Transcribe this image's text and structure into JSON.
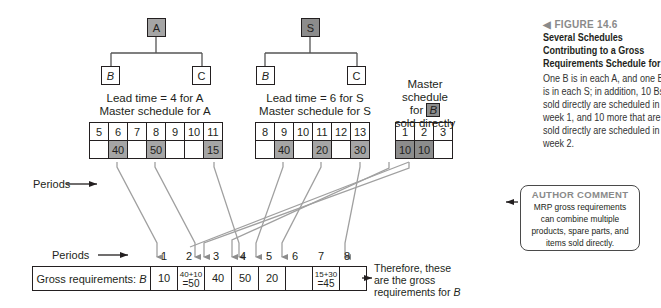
{
  "figure": {
    "number": "FIGURE 14.6",
    "marker_icon": "left-triangle",
    "title_lines": [
      "Several Schedules",
      "Contributing to a Gross",
      "Requirements Schedule for B"
    ],
    "description_lines": [
      "One B is in each A, and one B",
      "is in each S; in addition, 10 Bs",
      "sold directly are scheduled in",
      "week 1, and 10 more that are",
      "sold directly are scheduled in",
      "week 2."
    ]
  },
  "author_comment": {
    "heading": "AUTHOR COMMENT",
    "lines": [
      "MRP gross requirements",
      "can combine multiple",
      "products, spare parts, and",
      "items sold directly."
    ]
  },
  "trees": [
    {
      "parent": "A",
      "children": [
        "B",
        "C"
      ],
      "caption_lines": [
        "Lead time = 4 for A",
        "Master schedule for A"
      ]
    },
    {
      "parent": "S",
      "children": [
        "B",
        "C"
      ],
      "caption_lines": [
        "Lead time = 6 for S",
        "Master schedule for S"
      ]
    }
  ],
  "direct_caption": {
    "line1": "Master schedule",
    "line2_pre": "for",
    "line2_item": "B",
    "line3": "sold directly"
  },
  "periods_label": "Periods",
  "schedules": {
    "A": {
      "periods": [
        "5",
        "6",
        "7",
        "8",
        "9",
        "10",
        "11"
      ],
      "quantities": [
        "",
        "40",
        "",
        "50",
        "",
        "",
        "15"
      ]
    },
    "S": {
      "periods": [
        "8",
        "9",
        "10",
        "11",
        "12",
        "13"
      ],
      "quantities": [
        "",
        "40",
        "",
        "20",
        "",
        "30"
      ]
    },
    "direct": {
      "periods": [
        "1",
        "2",
        "3"
      ],
      "quantities": [
        "10",
        "10",
        ""
      ]
    }
  },
  "gross": {
    "label": "Gross requirements:",
    "label_item": "B",
    "periods": [
      "1",
      "2",
      "3",
      "4",
      "5",
      "6",
      "7",
      "8"
    ],
    "cells": [
      {
        "top": "",
        "value": "10"
      },
      {
        "top": "40+10",
        "value": "=50"
      },
      {
        "top": "",
        "value": "40"
      },
      {
        "top": "",
        "value": "50"
      },
      {
        "top": "",
        "value": "20"
      },
      {
        "top": "",
        "value": ""
      },
      {
        "top": "15+30",
        "value": "=45"
      },
      {
        "top": "",
        "value": ""
      }
    ]
  },
  "therefore_lines": [
    "Therefore, these",
    "are the gross",
    "requirements for"
  ],
  "therefore_item": "B"
}
